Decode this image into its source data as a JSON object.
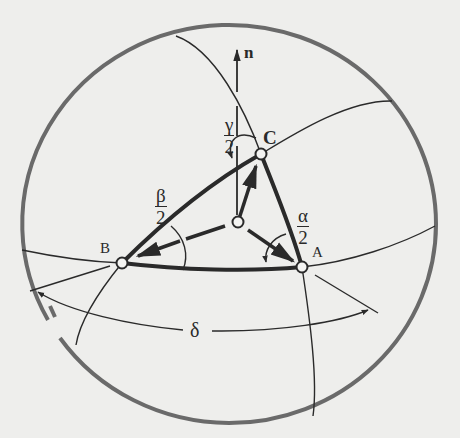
{
  "figure": {
    "type": "spherical-triangle-diagram",
    "colors": {
      "background": "#eeeeec",
      "sphere_outline": "#6a6a6a",
      "ink": "#2a2a2a"
    },
    "vector": {
      "label": "n"
    },
    "vertices": [
      {
        "id": "A",
        "label": "A"
      },
      {
        "id": "B",
        "label": "B"
      },
      {
        "id": "C",
        "label": "C"
      }
    ],
    "angles": [
      {
        "id": "alpha_half",
        "numerator": "α",
        "denominator": "2"
      },
      {
        "id": "beta_half",
        "numerator": "β",
        "denominator": "2"
      },
      {
        "id": "gamma_half",
        "numerator": "γ",
        "denominator": "2"
      }
    ],
    "arc_angle": {
      "label": "δ"
    }
  }
}
